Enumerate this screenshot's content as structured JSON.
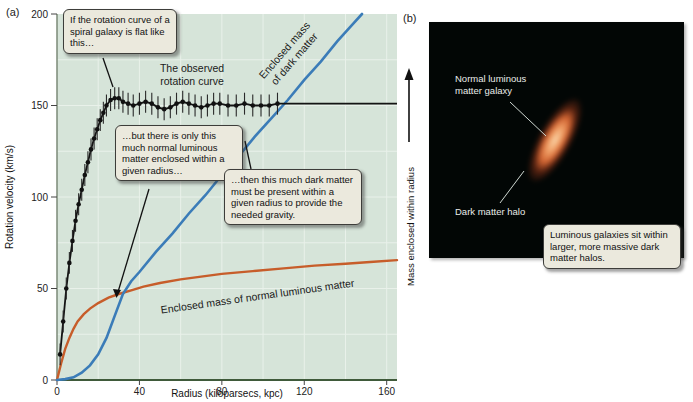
{
  "colors": {
    "plot_bg": "#d6e4d9",
    "grid": "#e9f1ea",
    "axis_left": "#7b8a77",
    "axis_bottom": "#3f5a3a",
    "observed": "#141414",
    "dark_matter": "#3b7cb8",
    "luminous": "#c75d2a",
    "callout_bg": "#ebe9dd",
    "halo_teal": "#2f6e61",
    "galaxy_orange": "#d06331"
  },
  "panel_a": {
    "label": "(a)",
    "annotations": {
      "callout_flat": "If the rotation curve of a spiral galaxy is flat like this…",
      "callout_luminous": "…but there is only this much normal luminous matter enclosed within a given radius…",
      "callout_dark": "…then this much dark matter must be present within a given radius to provide the needed gravity."
    },
    "chart_data": {
      "type": "line",
      "title": "",
      "xlabel": "Radius (kiloparsecs, kpc)",
      "ylabel": "Rotation velocity (km/s)",
      "y2label": "Mass enclosed within radius",
      "xlim": [
        0,
        165
      ],
      "ylim": [
        0,
        200
      ],
      "xticks": [
        0,
        40,
        80,
        120,
        160
      ],
      "yticks": [
        0,
        50,
        100,
        150,
        200
      ],
      "grid": {
        "x_step": 20,
        "y_step": 25,
        "on": true
      },
      "legend_position": "inline-labels",
      "series": [
        {
          "name": "The observed rotation curve",
          "label_lines": [
            "The observed",
            "rotation curve"
          ],
          "style": "scatter+line",
          "error": 6,
          "points": [
            [
              1.5,
              14
            ],
            [
              3,
              32
            ],
            [
              4.5,
              50
            ],
            [
              6,
              64
            ],
            [
              7.5,
              76
            ],
            [
              9,
              87
            ],
            [
              10.5,
              96
            ],
            [
              12,
              104
            ],
            [
              13.5,
              112
            ],
            [
              15,
              119
            ],
            [
              16.5,
              126
            ],
            [
              18,
              132
            ],
            [
              19.5,
              137
            ],
            [
              21,
              142
            ],
            [
              22.5,
              146
            ],
            [
              24,
              150
            ],
            [
              26,
              153
            ],
            [
              28,
              154
            ],
            [
              30,
              154
            ],
            [
              32,
              152
            ],
            [
              34.5,
              151
            ],
            [
              37,
              150
            ],
            [
              40,
              151
            ],
            [
              43,
              152
            ],
            [
              46,
              151
            ],
            [
              49,
              149
            ],
            [
              52,
              148
            ],
            [
              55,
              149
            ],
            [
              58,
              151
            ],
            [
              61,
              152
            ],
            [
              64,
              151
            ],
            [
              67,
              150
            ],
            [
              70,
              149
            ],
            [
              73,
              150
            ],
            [
              76,
              151
            ],
            [
              79,
              151
            ],
            [
              83,
              150
            ],
            [
              87,
              150
            ],
            [
              91,
              151
            ],
            [
              95,
              150
            ],
            [
              99,
              150
            ],
            [
              103,
              150
            ],
            [
              107,
              151
            ]
          ],
          "line_extra": [
            [
              112,
              151
            ],
            [
              125,
              151
            ],
            [
              140,
              151
            ],
            [
              165,
              151
            ]
          ]
        },
        {
          "name": "Enclosed mass of dark matter",
          "label_lines": [
            "Enclosed mass",
            "of dark matter"
          ],
          "style": "line",
          "points": [
            [
              0,
              0
            ],
            [
              4,
              0.5
            ],
            [
              8,
              1.5
            ],
            [
              12,
              4
            ],
            [
              16,
              8
            ],
            [
              20,
              14
            ],
            [
              24,
              23
            ],
            [
              28,
              35
            ],
            [
              32,
              47
            ],
            [
              36,
              54
            ],
            [
              40,
              59
            ],
            [
              48,
              70
            ],
            [
              56,
              80
            ],
            [
              64,
              91
            ],
            [
              72,
              101
            ],
            [
              80,
              112
            ],
            [
              88,
              122
            ],
            [
              96,
              133
            ],
            [
              104,
              143
            ],
            [
              112,
              153
            ],
            [
              120,
              164
            ],
            [
              128,
              174
            ],
            [
              136,
              185
            ],
            [
              144,
              195
            ],
            [
              148,
              200
            ]
          ]
        },
        {
          "name": "Enclosed mass of normal luminous matter",
          "label_lines": [
            "Enclosed mass of normal luminous matter"
          ],
          "style": "line",
          "points": [
            [
              0,
              0
            ],
            [
              2,
              9
            ],
            [
              4,
              17
            ],
            [
              6,
              23
            ],
            [
              8,
              28
            ],
            [
              10,
              32
            ],
            [
              13,
              36
            ],
            [
              16,
              39
            ],
            [
              20,
              42
            ],
            [
              25,
              45
            ],
            [
              30,
              47
            ],
            [
              36,
              49
            ],
            [
              42,
              51
            ],
            [
              50,
              53
            ],
            [
              60,
              55
            ],
            [
              70,
              56.5
            ],
            [
              80,
              58
            ],
            [
              95,
              59.5
            ],
            [
              110,
              61
            ],
            [
              125,
              62.5
            ],
            [
              140,
              63.5
            ],
            [
              152,
              64.5
            ],
            [
              165,
              65.5
            ]
          ]
        }
      ]
    }
  },
  "panel_b": {
    "label": "(b)",
    "galaxy_label": "Normal luminous matter galaxy",
    "halo_label": "Dark matter halo",
    "callout": "Luminous galaxies sit within larger, more massive dark matter halos."
  }
}
